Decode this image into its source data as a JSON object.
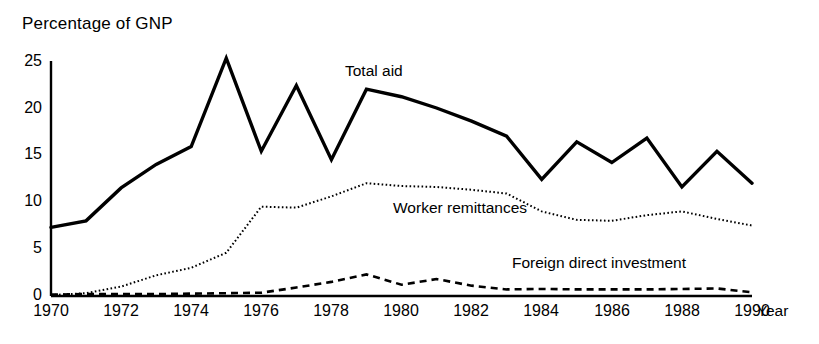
{
  "chart_data": {
    "type": "line",
    "title": "Percentage of GNP",
    "xlabel": "Year",
    "ylabel": "",
    "xlim": [
      1970,
      1990
    ],
    "ylim": [
      0,
      25
    ],
    "yticks": [
      0,
      5,
      10,
      15,
      20,
      25
    ],
    "xticks": [
      1970,
      1972,
      1974,
      1976,
      1978,
      1980,
      1982,
      1984,
      1986,
      1988,
      1990
    ],
    "ytick_labels": [
      "0",
      "5",
      "10",
      "15",
      "20",
      "25"
    ],
    "xtick_labels": [
      "1970",
      "1972",
      "1974",
      "1976",
      "1978",
      "1980",
      "1982",
      "1984",
      "1986",
      "1988",
      "1990"
    ],
    "grid": false,
    "legend": "inline-annotations",
    "x": [
      1970,
      1971,
      1972,
      1973,
      1974,
      1975,
      1976,
      1977,
      1978,
      1979,
      1980,
      1981,
      1982,
      1983,
      1984,
      1985,
      1986,
      1987,
      1988,
      1989,
      1990
    ],
    "series": [
      {
        "name": "Total aid",
        "style": "solid",
        "color": "#000000",
        "values": [
          7.3,
          8.0,
          11.5,
          14.0,
          15.9,
          25.3,
          15.4,
          22.4,
          14.5,
          22.0,
          21.2,
          20.0,
          18.6,
          17.0,
          12.4,
          16.4,
          14.2,
          16.8,
          11.6,
          15.4,
          12.0
        ]
      },
      {
        "name": "Worker remittances",
        "style": "dotted",
        "color": "#000000",
        "values": [
          0.1,
          0.3,
          1.0,
          2.2,
          3.0,
          4.6,
          9.5,
          9.4,
          10.6,
          12.0,
          11.7,
          11.6,
          11.3,
          10.9,
          9.0,
          8.1,
          8.0,
          8.6,
          9.0,
          8.2,
          7.5
        ]
      },
      {
        "name": "Foreign direct investment",
        "style": "dashed",
        "color": "#000000",
        "values": [
          0.15,
          0.2,
          0.2,
          0.2,
          0.25,
          0.3,
          0.35,
          0.9,
          1.5,
          2.3,
          1.2,
          1.8,
          1.1,
          0.7,
          0.75,
          0.7,
          0.7,
          0.7,
          0.75,
          0.8,
          0.4
        ]
      }
    ],
    "annotations": [
      {
        "text": "Total aid",
        "series": "Total aid"
      },
      {
        "text": "Worker remittances",
        "series": "Worker remittances"
      },
      {
        "text": "Foreign direct investment",
        "series": "Foreign direct investment"
      }
    ]
  }
}
